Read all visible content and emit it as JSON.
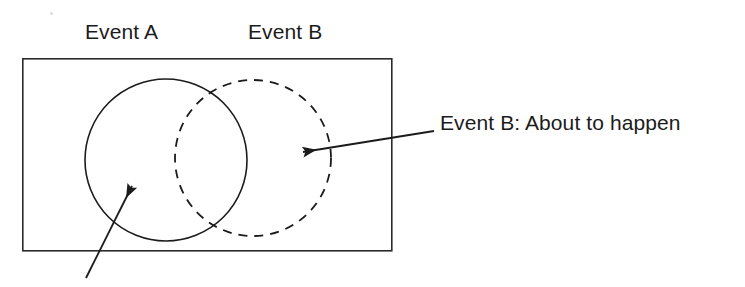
{
  "figure": {
    "type": "venn-diagram",
    "title": "",
    "background_color": "#ffffff",
    "stroke_color": "#1b1b1b",
    "labels": {
      "event_a": "Event A",
      "event_b": "Event B",
      "callout_event_b": "Event B:  About to happen"
    },
    "shapes": {
      "sample_space_rect": {
        "name": "sample-space-rectangle",
        "x": 22,
        "y": 58,
        "width": 369,
        "height": 192,
        "stroke": "#2b2b2b",
        "stroke_width": 1.6,
        "fill": "none",
        "line_style": "solid"
      },
      "circle_event_a": {
        "name": "event-a-circle",
        "cx": 166,
        "cy": 160,
        "r": 81,
        "stroke": "#1b1b1b",
        "stroke_width": 1.6,
        "fill": "none",
        "line_style": "solid"
      },
      "circle_event_b": {
        "name": "event-b-circle",
        "cx": 253,
        "cy": 158,
        "r": 78,
        "stroke": "#1b1b1b",
        "stroke_width": 1.8,
        "fill": "none",
        "line_style": "dashed",
        "dash_pattern": "9 7"
      }
    },
    "arrows": {
      "arrow_to_event_b": {
        "name": "arrow-to-event-b",
        "x1": 434,
        "y1": 131,
        "x2": 303,
        "y2": 152,
        "stroke": "#1b1b1b",
        "stroke_width": 1.8,
        "head": "end"
      },
      "arrow_to_event_a": {
        "name": "arrow-to-event-a",
        "x1": 86,
        "y1": 278,
        "x2": 132,
        "y2": 186,
        "stroke": "#1b1b1b",
        "stroke_width": 1.8,
        "head": "end"
      }
    },
    "artifacts": {
      "speck": {
        "x": 50,
        "y": 12,
        "size": 3
      }
    }
  }
}
